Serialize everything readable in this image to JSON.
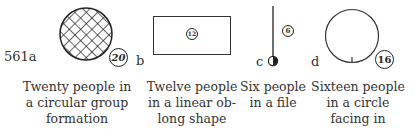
{
  "figure": {
    "number_label": "561a",
    "panels": [
      {
        "letter": "",
        "count": "20",
        "shape": "crosshatched-filled-circle",
        "caption_lines": [
          "Twenty people in",
          "a circular group",
          "formation"
        ]
      },
      {
        "letter": "b",
        "count": "12",
        "shape": "oblong-rectangle",
        "caption_lines": [
          "Twelve people",
          "in a linear ob-",
          "long shape"
        ]
      },
      {
        "letter": "c",
        "count": "6",
        "shape": "vertical-line-file",
        "caption_lines": [
          "Six people",
          "in a file"
        ]
      },
      {
        "letter": "d",
        "count": "16",
        "shape": "open-circle-facing-in",
        "caption_lines": [
          "Sixteen people",
          "in a circle",
          "facing in"
        ]
      }
    ]
  }
}
